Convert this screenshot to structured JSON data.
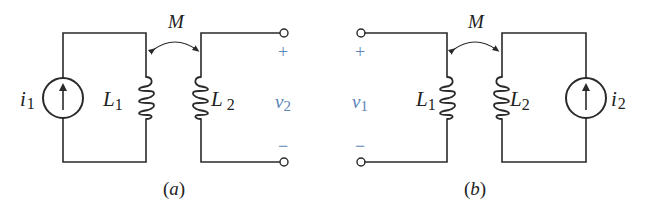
{
  "figure": {
    "colors": {
      "wire": "#2a2a2a",
      "port_label": "#5b86b8",
      "background": "#ffffff"
    },
    "circuit_a": {
      "caption_open": "(",
      "caption_letter": "a",
      "caption_close": ")",
      "source_label": "i",
      "source_sub": "1",
      "source_direction": "up-arrow",
      "inductor1_label": "L",
      "inductor1_sub": "1",
      "inductor2_label": "L",
      "inductor2_sub": "2",
      "mutual_label": "M",
      "port_voltage_label": "v",
      "port_voltage_sub": "2",
      "port_plus": "+",
      "port_minus": "−"
    },
    "circuit_b": {
      "caption_open": "(",
      "caption_letter": "b",
      "caption_close": ")",
      "source_label": "i",
      "source_sub": "2",
      "source_direction": "up-arrow",
      "inductor1_label": "L",
      "inductor1_sub": "1",
      "inductor2_label": "L",
      "inductor2_sub": "2",
      "mutual_label": "M",
      "port_voltage_label": "v",
      "port_voltage_sub": "1",
      "port_plus": "+",
      "port_minus": "−"
    }
  }
}
